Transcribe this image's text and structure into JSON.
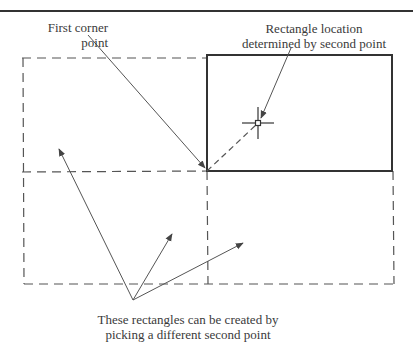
{
  "diagram": {
    "type": "rectangle-corner-placement",
    "labels": {
      "first_corner": [
        "First corner",
        "point"
      ],
      "rect_location": [
        "Rectangle location",
        "determined by second point"
      ],
      "alternatives": [
        "These rectangles can be created by",
        "picking a different second point"
      ]
    },
    "geometry": {
      "top_rule_y": 11,
      "corner_point": [
        207,
        171
      ],
      "second_point": [
        258,
        123
      ],
      "solid_rect": {
        "x1": 207,
        "y1": 55,
        "x2": 392,
        "y2": 171
      },
      "dashed_outer": {
        "x1": 22,
        "y1": 58,
        "x2": 394,
        "y2": 284
      }
    },
    "colors": {
      "line": "#333333",
      "dash": "#555555",
      "text": "#3a3a3a"
    }
  }
}
